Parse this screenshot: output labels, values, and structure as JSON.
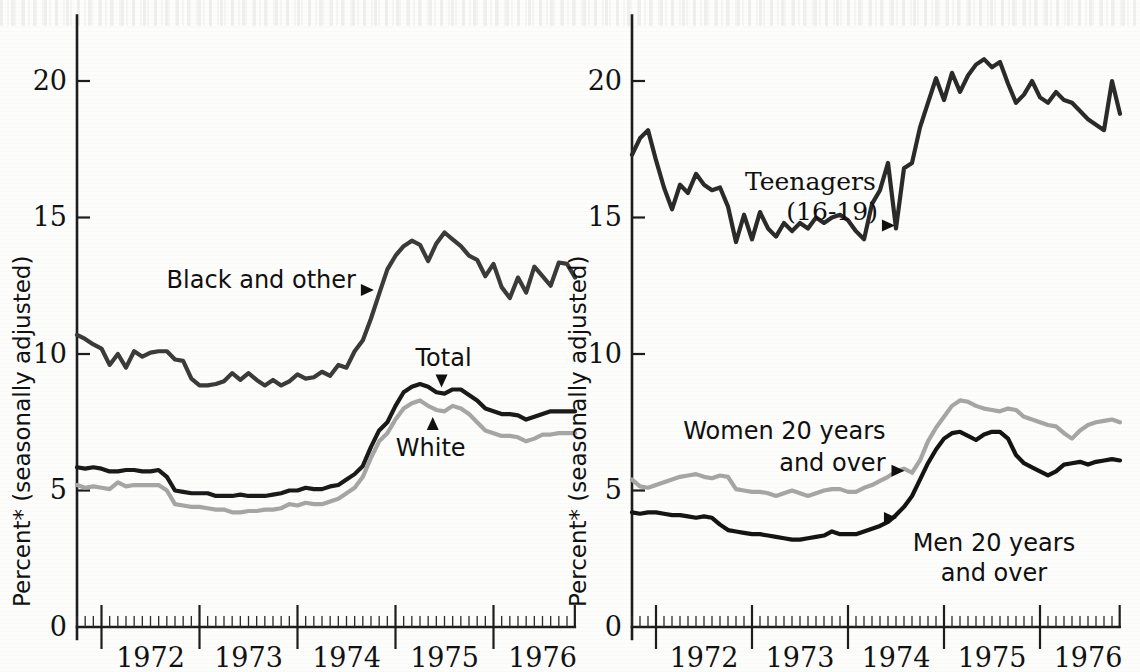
{
  "figure": {
    "background_color": "#fdfdfc",
    "panels": [
      "left",
      "right"
    ]
  },
  "axis": {
    "y_title": "Percent* (seasonally adjusted)",
    "y_ticks": [
      "0",
      "5",
      "10",
      "15",
      "20"
    ],
    "y_tick_values": [
      0,
      5,
      10,
      15,
      20
    ],
    "x_ticks": [
      "1972",
      "1973",
      "1974",
      "1975",
      "1976"
    ],
    "x_tick_values": [
      1972,
      1973,
      1974,
      1975,
      1976
    ]
  },
  "colors": {
    "black_line": "#1a1a1a",
    "dark_gray_line": "#3b3b3b",
    "light_gray_line": "#a6a6a6",
    "axis": "#1d1d1d",
    "text": "#111111"
  },
  "labels": {
    "black_and_other": "Black and other",
    "total": "Total",
    "white": "White",
    "teenagers_line1": "Teenagers",
    "teenagers_line2": "(16-19)",
    "women_line1": "Women 20 years",
    "women_line2": "and over",
    "men_line1": "Men 20 years",
    "men_line2": "and over"
  },
  "chart_data": [
    {
      "type": "line",
      "panel": "left",
      "title": "",
      "xlabel": "",
      "ylabel": "Percent* (seasonally adjusted)",
      "xlim": [
        1971.75,
        1976.83
      ],
      "ylim": [
        0,
        22.5
      ],
      "y_ticks": [
        0,
        5,
        10,
        15,
        20
      ],
      "x_ticks": [
        1972,
        1973,
        1974,
        1975,
        1976
      ],
      "grid": false,
      "legend": "inline-annotations",
      "x": [
        1971.75,
        1971.833,
        1971.917,
        1972.0,
        1972.083,
        1972.167,
        1972.25,
        1972.333,
        1972.417,
        1972.5,
        1972.583,
        1972.667,
        1972.75,
        1972.833,
        1972.917,
        1973.0,
        1973.083,
        1973.167,
        1973.25,
        1973.333,
        1973.417,
        1973.5,
        1973.583,
        1973.667,
        1973.75,
        1973.833,
        1973.917,
        1974.0,
        1974.083,
        1974.167,
        1974.25,
        1974.333,
        1974.417,
        1974.5,
        1974.583,
        1974.667,
        1974.75,
        1974.833,
        1974.917,
        1975.0,
        1975.083,
        1975.167,
        1975.25,
        1975.333,
        1975.417,
        1975.5,
        1975.583,
        1975.667,
        1975.75,
        1975.833,
        1975.917,
        1976.0,
        1976.083,
        1976.167,
        1976.25,
        1976.333,
        1976.417,
        1976.5,
        1976.583,
        1976.667,
        1976.75,
        1976.833
      ],
      "series": [
        {
          "name": "Black and other",
          "color": "#3b3b3b",
          "width": 4.2,
          "values": [
            10.7,
            10.55,
            10.35,
            10.2,
            9.6,
            10.0,
            9.5,
            10.1,
            9.9,
            10.05,
            10.1,
            10.1,
            9.8,
            9.75,
            9.1,
            8.85,
            8.85,
            8.9,
            9.0,
            9.3,
            9.05,
            9.3,
            9.05,
            8.85,
            9.05,
            8.85,
            9.0,
            9.25,
            9.1,
            9.15,
            9.35,
            9.2,
            9.6,
            9.5,
            10.1,
            10.5,
            11.3,
            12.2,
            13.1,
            13.6,
            13.95,
            14.15,
            14.0,
            13.4,
            14.05,
            14.45,
            14.2,
            13.95,
            13.6,
            13.45,
            12.85,
            13.3,
            12.45,
            12.05,
            12.8,
            12.25,
            13.2,
            12.85,
            12.5,
            13.35,
            13.3,
            12.8
          ]
        },
        {
          "name": "Total",
          "color": "#1a1a1a",
          "width": 4.2,
          "values": [
            5.85,
            5.8,
            5.85,
            5.8,
            5.7,
            5.7,
            5.75,
            5.75,
            5.7,
            5.7,
            5.75,
            5.5,
            5.0,
            4.95,
            4.9,
            4.9,
            4.9,
            4.8,
            4.8,
            4.8,
            4.85,
            4.8,
            4.8,
            4.8,
            4.85,
            4.9,
            5.0,
            5.0,
            5.1,
            5.05,
            5.05,
            5.15,
            5.2,
            5.4,
            5.6,
            5.9,
            6.6,
            7.2,
            7.5,
            8.1,
            8.6,
            8.8,
            8.9,
            8.8,
            8.6,
            8.55,
            8.7,
            8.7,
            8.5,
            8.3,
            8.0,
            7.9,
            7.8,
            7.8,
            7.75,
            7.6,
            7.7,
            7.8,
            7.9,
            7.9,
            7.9,
            7.9
          ]
        },
        {
          "name": "White",
          "color": "#a6a6a6",
          "width": 4.2,
          "values": [
            5.2,
            5.1,
            5.15,
            5.1,
            5.05,
            5.3,
            5.15,
            5.2,
            5.2,
            5.2,
            5.2,
            5.0,
            4.5,
            4.45,
            4.4,
            4.4,
            4.35,
            4.3,
            4.3,
            4.2,
            4.2,
            4.25,
            4.25,
            4.3,
            4.3,
            4.35,
            4.5,
            4.45,
            4.55,
            4.5,
            4.5,
            4.6,
            4.7,
            4.9,
            5.1,
            5.5,
            6.2,
            6.8,
            7.1,
            7.6,
            8.0,
            8.2,
            8.3,
            8.1,
            7.95,
            7.9,
            8.1,
            8.0,
            7.8,
            7.5,
            7.2,
            7.1,
            7.0,
            7.0,
            6.95,
            6.8,
            6.9,
            7.05,
            7.05,
            7.1,
            7.1,
            7.1
          ]
        }
      ],
      "annotations": [
        {
          "text": "Black and other",
          "points_to_series": "Black and other",
          "x": 1974.83
        },
        {
          "text": "Total",
          "points_to_series": "Total",
          "x": 1975.42
        },
        {
          "text": "White",
          "points_to_series": "White",
          "x": 1975.33
        }
      ]
    },
    {
      "type": "line",
      "panel": "right",
      "title": "",
      "xlabel": "",
      "ylabel": "Percent* (seasonally adjusted)",
      "xlim": [
        1971.75,
        1976.83
      ],
      "ylim": [
        0,
        22.5
      ],
      "y_ticks": [
        0,
        5,
        10,
        15,
        20
      ],
      "x_ticks": [
        1972,
        1973,
        1974,
        1975,
        1976
      ],
      "grid": false,
      "legend": "inline-annotations",
      "x": [
        1971.75,
        1971.833,
        1971.917,
        1972.0,
        1972.083,
        1972.167,
        1972.25,
        1972.333,
        1972.417,
        1972.5,
        1972.583,
        1972.667,
        1972.75,
        1972.833,
        1972.917,
        1973.0,
        1973.083,
        1973.167,
        1973.25,
        1973.333,
        1973.417,
        1973.5,
        1973.583,
        1973.667,
        1973.75,
        1973.833,
        1973.917,
        1974.0,
        1974.083,
        1974.167,
        1974.25,
        1974.333,
        1974.417,
        1974.5,
        1974.583,
        1974.667,
        1974.75,
        1974.833,
        1974.917,
        1975.0,
        1975.083,
        1975.167,
        1975.25,
        1975.333,
        1975.417,
        1975.5,
        1975.583,
        1975.667,
        1975.75,
        1975.833,
        1975.917,
        1976.0,
        1976.083,
        1976.167,
        1976.25,
        1976.333,
        1976.417,
        1976.5,
        1976.583,
        1976.667,
        1976.75,
        1976.833
      ],
      "series": [
        {
          "name": "Teenagers (16-19)",
          "color": "#2b2b2b",
          "width": 4.2,
          "values": [
            17.3,
            17.9,
            18.2,
            17.1,
            16.1,
            15.3,
            16.2,
            15.9,
            16.6,
            16.2,
            16.0,
            16.1,
            15.4,
            14.1,
            15.1,
            14.2,
            15.2,
            14.6,
            14.3,
            14.8,
            14.5,
            14.8,
            14.6,
            15.0,
            14.8,
            15.0,
            15.1,
            14.9,
            14.5,
            14.2,
            15.5,
            16.0,
            17.0,
            14.6,
            16.8,
            17.0,
            18.3,
            19.2,
            20.1,
            19.3,
            20.3,
            19.6,
            20.2,
            20.6,
            20.8,
            20.5,
            20.7,
            19.9,
            19.2,
            19.5,
            20.0,
            19.4,
            19.2,
            19.6,
            19.3,
            19.2,
            18.9,
            18.6,
            18.4,
            18.2,
            20.0,
            18.8
          ]
        },
        {
          "name": "Women 20 years and over",
          "color": "#a6a6a6",
          "width": 4.2,
          "values": [
            5.4,
            5.15,
            5.1,
            5.2,
            5.3,
            5.4,
            5.5,
            5.55,
            5.6,
            5.5,
            5.45,
            5.55,
            5.5,
            5.05,
            5.0,
            4.95,
            4.95,
            4.9,
            4.8,
            4.9,
            5.0,
            4.9,
            4.8,
            4.9,
            5.0,
            5.05,
            5.05,
            4.95,
            4.95,
            5.1,
            5.2,
            5.35,
            5.5,
            5.7,
            5.8,
            5.65,
            6.1,
            6.8,
            7.3,
            7.7,
            8.1,
            8.3,
            8.25,
            8.1,
            8.0,
            7.95,
            7.9,
            8.0,
            7.95,
            7.7,
            7.6,
            7.5,
            7.4,
            7.35,
            7.1,
            6.9,
            7.2,
            7.4,
            7.5,
            7.55,
            7.6,
            7.5
          ]
        },
        {
          "name": "Men 20 years and over",
          "color": "#141414",
          "width": 4.2,
          "values": [
            4.2,
            4.15,
            4.2,
            4.2,
            4.15,
            4.1,
            4.1,
            4.05,
            4.0,
            4.05,
            4.0,
            3.75,
            3.55,
            3.5,
            3.45,
            3.4,
            3.4,
            3.35,
            3.3,
            3.25,
            3.2,
            3.2,
            3.25,
            3.3,
            3.35,
            3.5,
            3.4,
            3.4,
            3.4,
            3.5,
            3.6,
            3.7,
            3.85,
            4.1,
            4.4,
            4.8,
            5.4,
            6.0,
            6.5,
            6.9,
            7.1,
            7.15,
            7.0,
            6.85,
            7.05,
            7.15,
            7.15,
            6.9,
            6.3,
            6.0,
            5.85,
            5.7,
            5.55,
            5.7,
            5.95,
            6.0,
            6.05,
            5.95,
            6.05,
            6.1,
            6.15,
            6.1
          ]
        }
      ],
      "annotations": [
        {
          "text": "Teenagers (16-19)",
          "points_to_series": "Teenagers (16-19)",
          "x": 1974.5
        },
        {
          "text": "Women 20 years and over",
          "points_to_series": "Women 20 years and over",
          "x": 1974.6
        },
        {
          "text": "Men 20 years and over",
          "points_to_series": "Men 20 years and over",
          "x": 1974.5
        }
      ]
    }
  ]
}
